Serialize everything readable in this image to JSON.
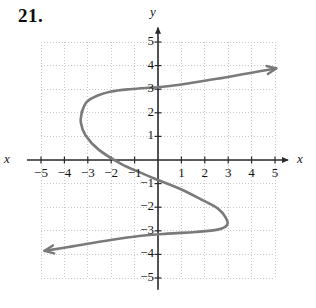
{
  "exercise": {
    "number": "21."
  },
  "axes": {
    "x_label_left": "x",
    "x_label_right": "x",
    "y_label_top": "y"
  },
  "chart_data": {
    "type": "line",
    "title": "21.",
    "xlabel": "x",
    "ylabel": "y",
    "xlim": [
      -5.5,
      5.5
    ],
    "ylim": [
      -5.5,
      5.5
    ],
    "grid": true,
    "grid_style": "dotted",
    "legend": "none",
    "x_ticks": [
      -5,
      -4,
      -3,
      -2,
      -1,
      1,
      2,
      3,
      4,
      5
    ],
    "y_ticks": [
      5,
      4,
      3,
      2,
      1,
      -1,
      -2,
      -3,
      -4,
      -5
    ],
    "x_tick_labels": [
      "-5",
      "-4",
      "-3",
      "-2",
      "-1",
      "1",
      "2",
      "3",
      "4",
      "5"
    ],
    "y_tick_labels": [
      "5",
      "4",
      "3",
      "2",
      "1",
      "-1",
      "-2",
      "-3",
      "-4",
      "-5"
    ],
    "curve_color": "#7a7a7a",
    "axis_color": "#2a2a2a",
    "grid_color": "#c9c9c9",
    "series": [
      {
        "name": "upper-branch",
        "arrow_end": "upper-right",
        "points": [
          [
            -3.25,
            2.05
          ],
          [
            -3.05,
            2.45
          ],
          [
            -2.6,
            2.72
          ],
          [
            -2.0,
            2.9
          ],
          [
            -1.2,
            3.0
          ],
          [
            -0.4,
            3.06
          ],
          [
            0.0,
            3.08
          ],
          [
            1.0,
            3.2
          ],
          [
            2.0,
            3.36
          ],
          [
            3.0,
            3.52
          ],
          [
            4.0,
            3.7
          ],
          [
            5.05,
            3.88
          ]
        ]
      },
      {
        "name": "lower-branch",
        "arrow_end": "lower-left",
        "points": [
          [
            -3.25,
            2.05
          ],
          [
            -3.3,
            1.6
          ],
          [
            -3.1,
            1.05
          ],
          [
            -2.55,
            0.45
          ],
          [
            -1.6,
            -0.15
          ],
          [
            -0.6,
            -0.6
          ],
          [
            0.0,
            -0.85
          ],
          [
            1.0,
            -1.25
          ],
          [
            1.9,
            -1.7
          ],
          [
            2.55,
            -2.05
          ],
          [
            2.9,
            -2.45
          ],
          [
            2.95,
            -2.75
          ],
          [
            2.55,
            -2.95
          ],
          [
            1.6,
            -3.05
          ],
          [
            0.4,
            -3.12
          ],
          [
            -0.8,
            -3.22
          ],
          [
            -2.2,
            -3.42
          ],
          [
            -3.6,
            -3.65
          ],
          [
            -4.85,
            -3.85
          ]
        ]
      }
    ]
  }
}
